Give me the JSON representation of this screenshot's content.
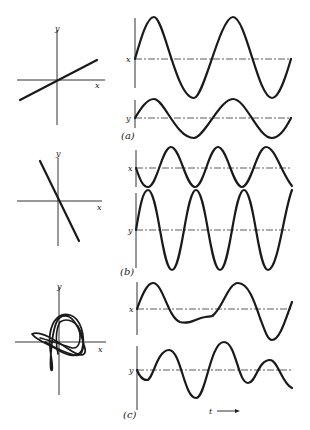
{
  "figure": {
    "panels": [
      {
        "id": "a",
        "label": "(a)",
        "phase_plot": {
          "x_label": "x",
          "y_label": "y",
          "description": "straight line with positive slope through origin"
        },
        "time_series": [
          {
            "label": "x",
            "description": "sinusoid, large amplitude, in phase with y"
          },
          {
            "label": "y",
            "description": "sinusoid, smaller amplitude, in phase with x"
          }
        ]
      },
      {
        "id": "b",
        "label": "(b)",
        "phase_plot": {
          "x_label": "x",
          "y_label": "y",
          "description": "straight line with negative slope through origin"
        },
        "time_series": [
          {
            "label": "x",
            "description": "sinusoid, small amplitude, 180° out of phase with y"
          },
          {
            "label": "y",
            "description": "sinusoid, large amplitude, 180° out of phase with x"
          }
        ]
      },
      {
        "id": "c",
        "label": "(c)",
        "phase_plot": {
          "x_label": "x",
          "y_label": "y",
          "description": "tangled closed looping trajectory (uncorrelated)"
        },
        "time_series": [
          {
            "label": "x",
            "description": "irregular oscillation"
          },
          {
            "label": "y",
            "description": "irregular oscillation, uncorrelated with x"
          }
        ]
      }
    ],
    "time_axis_label": "t",
    "time_arrow": "→"
  }
}
